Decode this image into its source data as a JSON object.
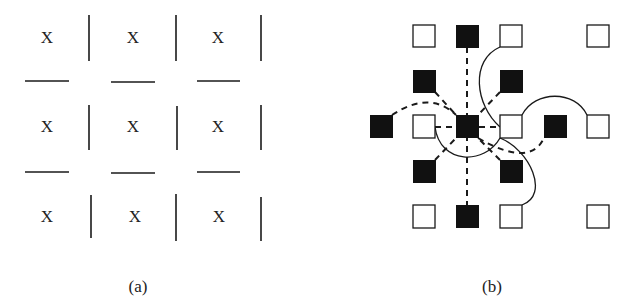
{
  "panels": {
    "a": {
      "caption": "(a)",
      "cell_symbol": "X",
      "grid": {
        "rows": 3,
        "cols": 3
      }
    },
    "b": {
      "caption": "(b)",
      "description": "Grid of open (white) and filled (black) square nodes; dashed links from the central black node to its neighbours, solid curved links among white nodes.",
      "node_counts": {
        "filled": 9,
        "open": 10
      }
    }
  },
  "colors": {
    "ink": "#1a1a1a",
    "background": "#ffffff"
  }
}
